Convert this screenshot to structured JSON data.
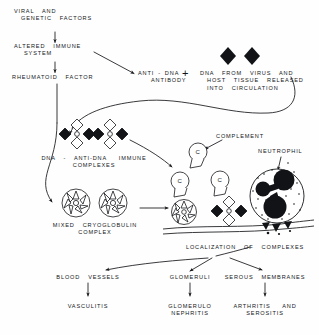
{
  "diagram": {
    "type": "flowchart",
    "ink_color": "#15171a",
    "background_color": "#fefefe",
    "nodes": {
      "viral_genetic": {
        "line1": "VIRAL  AND",
        "line2": "GENETIC  FACTORS"
      },
      "altered_immune": {
        "line1": "ALTERED  IMMUNE",
        "line2": "SYSTEM"
      },
      "rheumatoid_factor": {
        "line1": "RHEUMATOID  FACTOR"
      },
      "anti_dna_antibody": {
        "line1": "ANTI - DNA",
        "line2": "ANTIBODY"
      },
      "plus": {
        "symbol": "+"
      },
      "dna_release": {
        "line1": "DNA  FROM  VIRUS  AND",
        "line2": "HOST  TISSUE  RELEASED",
        "line3": "INTO  CIRCULATION"
      },
      "immune_complexes": {
        "line1": "DNA  -  ANTI-DNA   IMMUNE",
        "line2": "COMPLEXES"
      },
      "cryoglobulin": {
        "line1": "MIXED  CRYOGLOBULIN",
        "line2": "COMPLEX"
      },
      "complement": {
        "line1": "COMPLEMENT",
        "glyph": "C"
      },
      "neutrophil": {
        "line1": "NEUTROPHIL"
      },
      "localization": {
        "line1": "LOCALIZATION  OF  COMPLEXES"
      },
      "blood_vessels": {
        "line1": "BLOOD  VESSELS"
      },
      "glomeruli": {
        "line1": "GLOMERULI"
      },
      "serous_membranes": {
        "line1": "SEROUS  MEMBRANES"
      },
      "vasculitis": {
        "line1": "VASCULITIS"
      },
      "glomerulonephritis": {
        "line1": "GLOMERULO",
        "line2": "NEPHRITIS"
      },
      "arthritis_serositis": {
        "line1": "ARTHRITIS   AND",
        "line2": "SEROSITIS"
      }
    },
    "icon_names": {
      "free_dna": "black-diamond-dna-icon",
      "immune_complex": "immune-complex-diamond-cluster-icon",
      "cryoglobulin": "cryoglobulin-spoked-wheel-icon",
      "complement": "complement-c-blob-icon",
      "neutrophil": "neutrophil-cell-icon",
      "membrane": "basement-membrane-line-icon"
    }
  }
}
